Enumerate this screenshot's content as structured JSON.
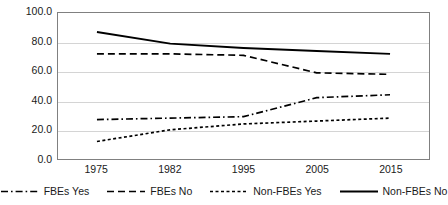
{
  "chart_data": {
    "type": "line",
    "title": "",
    "xlabel": "",
    "ylabel": "",
    "categories": [
      "1975",
      "1982",
      "1995",
      "2005",
      "2015"
    ],
    "ylim": [
      0,
      100
    ],
    "yticks": [
      0,
      20,
      40,
      60,
      80,
      100
    ],
    "ytick_labels": [
      "0.0",
      "20.0",
      "40.0",
      "60.0",
      "80.0",
      "100.0"
    ],
    "grid": true,
    "legend_position": "bottom",
    "series": [
      {
        "name": "FBEs Yes",
        "line_style": "dash-dot",
        "color": "#000000",
        "values": [
          27,
          28,
          29,
          42,
          44
        ]
      },
      {
        "name": "FBEs No",
        "line_style": "dashed",
        "color": "#000000",
        "values": [
          72,
          72,
          71,
          59,
          58
        ]
      },
      {
        "name": "Non-FBEs Yes",
        "line_style": "dotted",
        "color": "#000000",
        "values": [
          12,
          20,
          24,
          26,
          28
        ]
      },
      {
        "name": "Non-FBEs No",
        "line_style": "solid",
        "color": "#000000",
        "values": [
          87,
          79,
          76,
          74,
          72
        ]
      }
    ]
  }
}
